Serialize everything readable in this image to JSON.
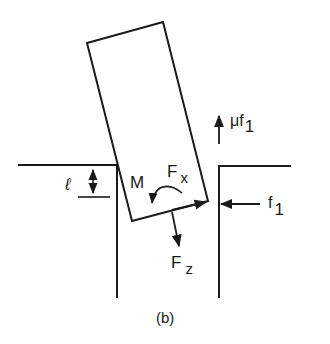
{
  "figure": {
    "caption": "(b)",
    "stroke_color": "#1a1a1a",
    "background": "#ffffff"
  },
  "labels": {
    "depth": "ℓ",
    "moment": "M",
    "force_x_main": "F",
    "force_x_sub": "x",
    "force_z_main": "F",
    "force_z_sub": "z",
    "friction_main": "μf",
    "friction_sub": "1",
    "normal_main": "f",
    "normal_sub": "1"
  }
}
